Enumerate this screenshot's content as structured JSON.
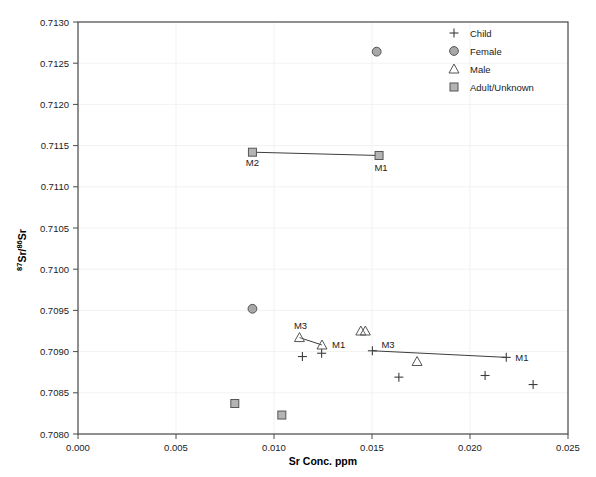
{
  "chart_data": {
    "type": "scatter",
    "title": "",
    "xlabel": "Sr Conc. ppm",
    "ylabel": "87Sr/86Sr",
    "ylabel_parts": {
      "sup1": "87",
      "mid": "Sr/",
      "sup2": "86",
      "end": "Sr"
    },
    "xlim": [
      0.0,
      0.025
    ],
    "ylim": [
      0.708,
      0.713
    ],
    "xticks": [
      "0.000",
      "0.005",
      "0.010",
      "0.015",
      "0.020",
      "0.025"
    ],
    "xtick_values": [
      0.0,
      0.005,
      0.01,
      0.015,
      0.02,
      0.025
    ],
    "yticks": [
      "0.7080",
      "0.7085",
      "0.7090",
      "0.7095",
      "0.7100",
      "0.7105",
      "0.7110",
      "0.7115",
      "0.7120",
      "0.7125",
      "0.7130"
    ],
    "ytick_values": [
      0.708,
      0.7085,
      0.709,
      0.7095,
      0.71,
      0.7105,
      0.711,
      0.7115,
      0.712,
      0.7125,
      0.713
    ],
    "grid": true,
    "legend_position": "top-right",
    "legend": [
      {
        "marker": "plus",
        "label": "Child"
      },
      {
        "marker": "circle",
        "label": "Female"
      },
      {
        "marker": "triangle",
        "label": "Male"
      },
      {
        "marker": "square",
        "label": "Adult/Unknown"
      }
    ],
    "series": [
      {
        "name": "Child",
        "marker": "plus",
        "points": [
          {
            "x": 0.01145,
            "y": 0.70894
          },
          {
            "x": 0.01243,
            "y": 0.70898
          },
          {
            "x": 0.01502,
            "y": 0.70901
          },
          {
            "x": 0.01637,
            "y": 0.70869
          },
          {
            "x": 0.02077,
            "y": 0.70871
          },
          {
            "x": 0.02185,
            "y": 0.70893,
            "label": "M1"
          },
          {
            "x": 0.02322,
            "y": 0.7086
          }
        ]
      },
      {
        "name": "Female",
        "marker": "circle",
        "points": [
          {
            "x": 0.01524,
            "y": 0.71264
          },
          {
            "x": 0.0089,
            "y": 0.70952
          }
        ]
      },
      {
        "name": "Male",
        "marker": "triangle",
        "points": [
          {
            "x": 0.0113,
            "y": 0.70917,
            "label": "M3"
          },
          {
            "x": 0.01245,
            "y": 0.70908,
            "label": "M1"
          },
          {
            "x": 0.01443,
            "y": 0.70925
          },
          {
            "x": 0.01466,
            "y": 0.70925
          },
          {
            "x": 0.0173,
            "y": 0.70888
          }
        ]
      },
      {
        "name": "Adult/Unknown",
        "marker": "square",
        "points": [
          {
            "x": 0.0089,
            "y": 0.71142,
            "label": "M2"
          },
          {
            "x": 0.01536,
            "y": 0.71138,
            "label": "M1"
          },
          {
            "x": 0.008,
            "y": 0.70837
          },
          {
            "x": 0.0104,
            "y": 0.70823
          }
        ]
      }
    ],
    "connectors": [
      {
        "name": "M2-M1-square-link",
        "x1": 0.0089,
        "y1": 0.71142,
        "x2": 0.01536,
        "y2": 0.71138
      },
      {
        "name": "M3-M1-triangle-link",
        "x1": 0.0113,
        "y1": 0.70917,
        "x2": 0.01245,
        "y2": 0.70908
      },
      {
        "name": "M3-M1-child-link",
        "x1": 0.01502,
        "y1": 0.70901,
        "x2": 0.02185,
        "y2": 0.70893
      }
    ],
    "annotations": [
      {
        "text": "M2",
        "x": 0.0089,
        "y": 0.71142,
        "dx": 0,
        "dy": 14,
        "anchor": "middle"
      },
      {
        "text": "M1",
        "x": 0.01536,
        "y": 0.71138,
        "dx": 2,
        "dy": 16,
        "anchor": "middle"
      },
      {
        "text": "M3",
        "x": 0.0113,
        "y": 0.70917,
        "dx": 1,
        "dy": -9,
        "anchor": "middle"
      },
      {
        "text": "M1",
        "x": 0.01245,
        "y": 0.70908,
        "dx": 10,
        "dy": 3,
        "anchor": "start"
      },
      {
        "text": "M3",
        "x": 0.01502,
        "y": 0.70901,
        "dx": 9,
        "dy": -3,
        "anchor": "start"
      },
      {
        "text": "M1",
        "x": 0.02185,
        "y": 0.70893,
        "dx": 9,
        "dy": 4,
        "anchor": "start"
      }
    ]
  }
}
